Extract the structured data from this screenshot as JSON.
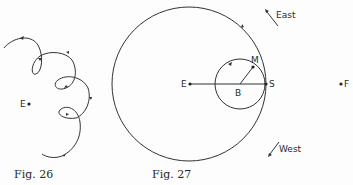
{
  "figures": [
    {
      "caption": "Fig. 26",
      "labels": {
        "earth": "E"
      },
      "description": "Looping path (epicycle-like loops) around point E with direction arrows"
    },
    {
      "caption": "Fig. 27",
      "labels": {
        "earth": "E",
        "center_small": "B",
        "moon": "M",
        "sun": "S",
        "far_point": "F",
        "east": "East",
        "west": "West"
      },
      "description": "Large circle centered at E, small circle centered at B on radius ES, point M on small circle, direction arrows East and West"
    }
  ],
  "colors": {
    "stroke": "#333333",
    "background": "#fdfdfd"
  }
}
